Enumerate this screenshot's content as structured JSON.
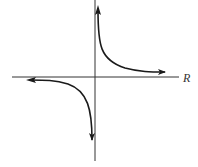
{
  "diagram": {
    "type": "hyperbola-graph",
    "horizontal_axis": {
      "label": "R"
    },
    "vertical_axis": {
      "label": ""
    },
    "branches": [
      {
        "name": "upper-right",
        "quadrant": "I"
      },
      {
        "name": "lower-left",
        "quadrant": "III"
      }
    ],
    "colors": {
      "stroke": "#1a1a1a",
      "axis": "#333333",
      "background": "#ffffff"
    }
  }
}
